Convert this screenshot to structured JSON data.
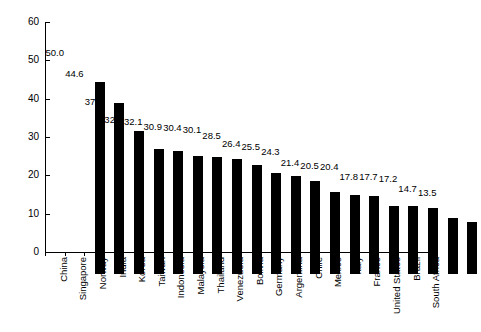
{
  "chart_data": {
    "type": "bar",
    "title": "",
    "subtitle": "",
    "xlabel": "",
    "ylabel": "",
    "ylim": [
      0,
      60
    ],
    "ytick_step": 10,
    "yticks": [
      "0",
      "10",
      "20",
      "30",
      "40",
      "50",
      "60"
    ],
    "grid": false,
    "legend": false,
    "bar_color": "#000000",
    "categories": [
      "China",
      "Singapore",
      "Norway",
      "India",
      "Korea",
      "Taiwan",
      "Indonesia",
      "Malaysia",
      "Thailand",
      "Venezuela",
      "Bolivia",
      "Germany",
      "Argentina",
      "Chile",
      "Mexico",
      "Italy",
      "France",
      "United States",
      "Brazil",
      "South Africa"
    ],
    "values": [
      50.0,
      44.6,
      37.4,
      32.7,
      32.1,
      30.9,
      30.4,
      30.1,
      28.5,
      26.4,
      25.5,
      24.3,
      21.4,
      20.5,
      20.4,
      17.8,
      17.7,
      17.2,
      14.7,
      13.5
    ],
    "value_labels": [
      "50.0",
      "44.6",
      "37.4",
      "32.7",
      "32.1",
      "30.9",
      "30.4",
      "30.1",
      "28.5",
      "26.4",
      "25.5",
      "24.3",
      "21.4",
      "20.5",
      "20.4",
      "17.8",
      "17.7",
      "17.2",
      "14.7",
      "13.5"
    ]
  }
}
